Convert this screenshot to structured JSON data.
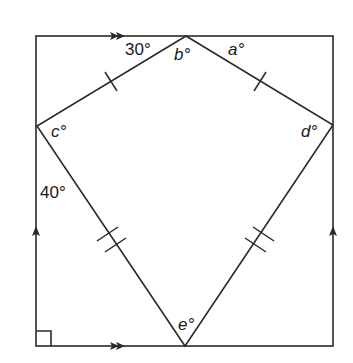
{
  "diagram": {
    "rectangle": {
      "top_left": [
        36,
        36
      ],
      "bottom_right": [
        333,
        346
      ]
    },
    "kite": {
      "vertices": {
        "top": [
          186,
          36
        ],
        "left": [
          37,
          126
        ],
        "right": [
          333,
          125
        ],
        "bottom": [
          185,
          346
        ]
      }
    },
    "labels": {
      "angle_30": "30°",
      "angle_40": "40°",
      "angle_a": "a°",
      "angle_b": "b°",
      "angle_c": "c°",
      "angle_d": "d°",
      "angle_e": "e°"
    },
    "markers": {
      "top_side_parallel": "double-arrow-right",
      "bottom_side_parallel": "double-arrow-right",
      "left_side_parallel": "single-arrow-up",
      "right_side_parallel": "single-arrow-up",
      "upper_kite_sides_equal": "single-tick",
      "lower_kite_sides_equal": "double-tick",
      "bottom_left_corner": "right-angle"
    },
    "colors": {
      "line": "#2a2a2a",
      "text": "#1a1a1a",
      "background": "#ffffff"
    }
  }
}
